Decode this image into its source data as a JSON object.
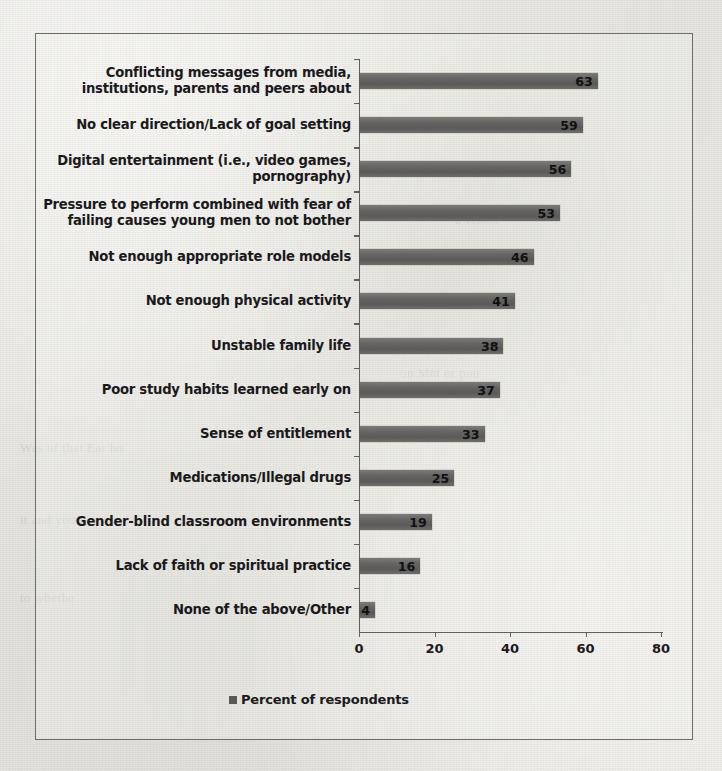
{
  "chart_data": {
    "type": "bar",
    "orientation": "horizontal",
    "title": "",
    "xlabel": "",
    "ylabel": "",
    "xlim": [
      0,
      80
    ],
    "xticks": [
      0,
      20,
      40,
      60,
      80
    ],
    "grid": false,
    "legend": {
      "position": "bottom-center",
      "entries": [
        "Percent of respondents"
      ],
      "marker_color": "#595856"
    },
    "series": [
      {
        "name": "Percent of respondents",
        "color": "#646361",
        "values": [
          63,
          59,
          56,
          53,
          46,
          41,
          38,
          37,
          33,
          25,
          19,
          16,
          4
        ]
      }
    ],
    "categories": [
      "Conflicting messages from media, institutions, parents and peers about",
      "No clear direction/Lack of goal setting",
      "Digital entertainment (i.e., video games, pornography)",
      "Pressure to perform combined with fear of failing causes young men to not bother",
      "Not enough appropriate role models",
      "Not enough physical activity",
      "Unstable family life",
      "Poor study habits learned early on",
      "Sense of entitlement",
      "Medications/Illegal drugs",
      "Gender-blind classroom environments",
      "Lack of faith or spiritual practice",
      "None of the above/Other"
    ],
    "category_lines": [
      [
        "Conflicting messages from media,",
        "institutions, parents and peers about"
      ],
      [
        "No clear direction/Lack of goal setting"
      ],
      [
        "Digital entertainment (i.e., video games,",
        "pornography)"
      ],
      [
        "Pressure to perform combined with fear of",
        "failing causes young men to not bother"
      ],
      [
        "Not enough appropriate role models"
      ],
      [
        "Not enough physical activity"
      ],
      [
        "Unstable family life"
      ],
      [
        "Poor study habits learned early on"
      ],
      [
        "Sense of entitlement"
      ],
      [
        "Medications/Illegal drugs"
      ],
      [
        "Gender-blind classroom environments"
      ],
      [
        "Lack of faith or spiritual practice"
      ],
      [
        "None of the above/Other"
      ]
    ],
    "data_labels": [
      "63",
      "59",
      "56",
      "53",
      "46",
      "41",
      "38",
      "37",
      "33",
      "25",
      "19",
      "16",
      "4"
    ],
    "xtick_labels": [
      "0",
      "20",
      "40",
      "60",
      "80"
    ]
  },
  "page": {
    "background_color": "#e9e8e4",
    "frame_color": "#6e6d69",
    "text_color": "#17161a"
  },
  "bleed_text": [
    "a vision",
    "at a m m n of th",
    "on Mnt or pou",
    "Was of that Ear ho",
    "it and you can comha",
    "to whethe"
  ]
}
